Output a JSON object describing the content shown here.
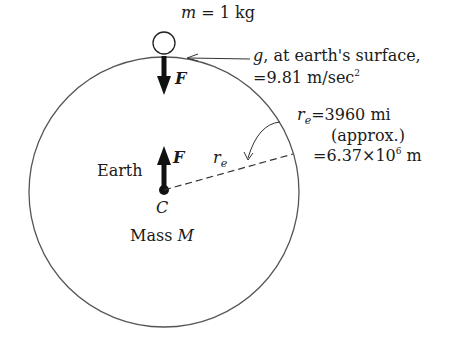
{
  "diagram": {
    "mass_label": {
      "var": "m",
      "eq": " = 1 kg"
    },
    "force_label": "F",
    "g_label": {
      "var": "g",
      "line1": ", at earth's surface,",
      "line2": "=9.81 m/sec",
      "line2_sup": "2"
    },
    "radius_label": {
      "var": "r",
      "sub": "e",
      "line1": "=3960 mi",
      "line2": "(approx.)",
      "line3": "=6.37×10",
      "line3_sup": "6",
      "line3_tail": " m"
    },
    "radius_inline": {
      "var": "r",
      "sub": "e"
    },
    "earth_label": "Earth",
    "center_label": "C",
    "mass_earth_label": {
      "text": "Mass ",
      "var": "M"
    }
  },
  "colors": {
    "ink": "#1a1a1a",
    "circle": "#555555"
  }
}
